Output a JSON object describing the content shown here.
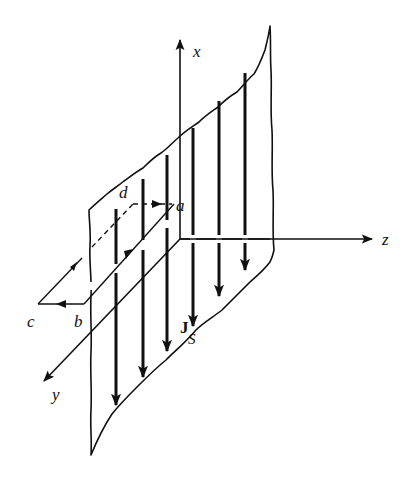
{
  "figure": {
    "colors": {
      "ink": "#111111",
      "background": "#ffffff"
    }
  },
  "axes": {
    "x": {
      "label": "x"
    },
    "y": {
      "label": "y"
    },
    "z": {
      "label": "z"
    }
  },
  "loop": {
    "corners": [
      "a",
      "b",
      "c",
      "d"
    ],
    "labels": {
      "a": "a",
      "b": "b",
      "c": "c",
      "d": "d"
    }
  },
  "current": {
    "symbol": "J",
    "subscript": "S",
    "direction": "-x",
    "arrow_count": 6
  }
}
